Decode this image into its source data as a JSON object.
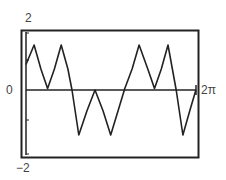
{
  "chart_data": {
    "type": "line",
    "title": "",
    "xlabel": "",
    "ylabel": "",
    "xlim": [
      0,
      6.2832
    ],
    "ylim": [
      -2,
      2
    ],
    "x_tick_labels": [
      "0",
      "2π"
    ],
    "y_tick_labels": [
      "2",
      "-2"
    ],
    "grid": false,
    "legend": [],
    "series": [
      {
        "name": "y",
        "x": [
          0.0,
          0.3,
          0.55,
          0.8,
          1.05,
          1.3,
          1.55,
          1.7,
          1.95,
          2.25,
          2.55,
          2.85,
          3.13,
          3.4,
          3.65,
          3.92,
          4.18,
          4.5,
          4.75,
          5.0,
          5.25,
          5.55,
          5.8,
          6.05,
          6.28
        ],
        "values": [
          0.85,
          1.5,
          0.7,
          0.05,
          0.7,
          1.5,
          0.7,
          0.0,
          -1.5,
          -0.7,
          0.0,
          -0.7,
          -1.5,
          -0.7,
          0.05,
          0.7,
          1.5,
          0.7,
          0.05,
          0.7,
          1.5,
          0.0,
          -1.5,
          -0.7,
          0.0
        ]
      }
    ]
  },
  "labels": {
    "y_max": "2",
    "y_min": "−2",
    "x_origin": "0",
    "x_max": "2π"
  },
  "colors": {
    "line": "#222222",
    "frame": "#222222",
    "text": "#444444"
  }
}
